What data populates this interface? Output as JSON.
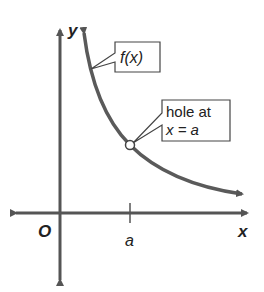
{
  "diagram": {
    "axis_labels": {
      "x": "x",
      "y": "y",
      "origin": "O"
    },
    "tick_label": "a",
    "function_label": "f(x)",
    "callout": {
      "line1": "hole at",
      "line2": "x = a"
    },
    "colors": {
      "axis": "#555555",
      "curve": "#5a5a5a",
      "text": "#222222",
      "background": "#ffffff"
    }
  }
}
